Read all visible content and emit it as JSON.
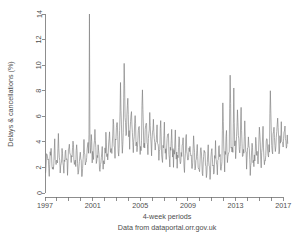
{
  "chart_data": {
    "type": "line",
    "title": "",
    "subtitle": "",
    "xlabel": "4-week periods",
    "ylabel": "Delays & cancellations (%)",
    "caption": "Data from dataportal.orr.gov.uk",
    "grid": false,
    "legend": "none",
    "line_color": "#7d7d7d",
    "axis_color": "#707070",
    "text_color": "#4d4d4d",
    "background": "#ffffff",
    "xlim": [
      1997.0,
      2017.4
    ],
    "ylim": [
      0,
      14
    ],
    "yticks": [
      0,
      2,
      4,
      6,
      8,
      10,
      12,
      14
    ],
    "ytick_labels": [
      "0",
      "2",
      "4",
      "6",
      "8",
      "10",
      "12",
      "14"
    ],
    "xticks": [
      1997,
      1998,
      1999,
      2000,
      2001,
      2002,
      2003,
      2004,
      2005,
      2006,
      2007,
      2008,
      2009,
      2010,
      2011,
      2012,
      2013,
      2014,
      2015,
      2016,
      2017
    ],
    "xtick_labels_shown": [
      "1997",
      "2001",
      "2005",
      "2009",
      "2013",
      "2017"
    ],
    "xtick_labels_at": [
      1997,
      2001,
      2005,
      2009,
      2013,
      2017
    ],
    "series": [
      {
        "name": "Delays & cancellations (%)",
        "x_start": 1997.05,
        "x_step": 0.0767,
        "values": [
          1.9,
          2.6,
          3.3,
          2.2,
          1.7,
          2.6,
          3.5,
          2.4,
          1.8,
          2.7,
          3.8,
          2.5,
          2.0,
          2.9,
          4.1,
          2.6,
          1.9,
          2.5,
          3.4,
          2.3,
          1.6,
          2.4,
          3.2,
          2.1,
          1.8,
          2.8,
          3.9,
          2.7,
          2.1,
          3.0,
          4.2,
          2.8,
          2.0,
          2.6,
          3.3,
          2.2,
          1.5,
          2.3,
          3.1,
          2.0,
          1.7,
          2.5,
          3.6,
          2.4,
          1.9,
          2.8,
          4.0,
          2.6,
          2.2,
          3.1,
          4.3,
          2.9,
          2.3,
          3.2,
          4.6,
          3.0,
          2.1,
          2.7,
          3.5,
          2.3,
          1.8,
          2.6,
          3.4,
          2.2,
          2.0,
          2.9,
          4.4,
          3.1,
          2.6,
          3.6,
          5.0,
          3.4,
          2.8,
          3.9,
          5.6,
          3.8,
          3.0,
          4.2,
          6.0,
          4.0,
          3.1,
          4.4,
          8.2,
          5.0,
          3.5,
          4.8,
          9.8,
          6.2,
          4.4,
          5.5,
          7.0,
          4.8,
          3.8,
          4.9,
          6.1,
          4.2,
          3.4,
          4.5,
          5.7,
          3.9,
          3.2,
          4.3,
          5.4,
          3.7,
          3.0,
          4.1,
          8.6,
          4.6,
          3.3,
          4.4,
          5.8,
          4.0,
          3.1,
          4.2,
          6.3,
          4.1,
          3.2,
          4.3,
          5.5,
          3.8,
          3.0,
          4.0,
          5.2,
          3.6,
          2.8,
          3.8,
          5.1,
          3.5,
          2.7,
          3.7,
          4.9,
          3.4,
          2.6,
          3.6,
          4.8,
          3.3,
          2.5,
          3.5,
          4.7,
          3.2,
          2.4,
          3.4,
          4.6,
          3.1,
          2.3,
          3.3,
          4.5,
          3.0,
          2.2,
          3.2,
          4.4,
          2.9,
          2.1,
          3.1,
          4.2,
          2.8,
          2.0,
          3.0,
          4.1,
          2.7,
          1.9,
          2.9,
          4.0,
          2.6,
          1.8,
          2.8,
          3.9,
          2.5,
          1.7,
          2.7,
          3.8,
          2.4,
          1.6,
          2.6,
          3.7,
          2.3,
          1.5,
          2.5,
          3.6,
          2.2,
          1.4,
          2.4,
          3.5,
          2.1,
          1.6,
          2.6,
          3.8,
          2.4,
          1.8,
          2.8,
          4.0,
          2.6,
          2.0,
          3.0,
          6.4,
          3.6,
          2.2,
          3.2,
          4.4,
          2.9,
          2.4,
          3.4,
          8.9,
          4.0,
          2.6,
          3.6,
          7.8,
          4.2,
          2.8,
          3.8,
          6.6,
          4.7,
          3.0,
          4.0,
          6.2,
          3.8,
          2.5,
          3.5,
          5.0,
          3.2,
          2.1,
          3.1,
          4.3,
          2.8,
          1.9,
          2.9,
          4.1,
          2.7,
          2.0,
          3.0,
          4.6,
          3.0,
          2.2,
          3.2,
          5.4,
          3.4,
          2.4,
          3.4,
          4.8,
          3.1,
          2.3,
          3.3,
          4.5,
          3.0,
          2.6,
          3.6,
          8.0,
          4.4,
          3.0,
          4.0,
          5.2,
          3.5,
          3.2,
          4.2,
          5.8,
          3.9,
          3.3,
          4.3,
          5.0,
          3.7,
          3.1,
          4.1,
          5.3,
          3.8,
          3.4,
          4.4,
          5.6,
          4.0,
          3.5,
          4.5,
          6.0,
          4.2,
          3.6,
          4.6,
          6.4,
          4.4,
          3.8,
          4.8,
          8.5,
          5.0,
          4.2,
          5.2,
          6.8,
          4.8,
          4.4,
          5.4,
          7.8,
          5.2,
          4.6,
          5.6,
          6.2,
          4.9,
          4.0,
          5.0,
          5.8,
          4.5,
          3.4,
          4.2,
          5.1,
          3.0
        ],
        "max_spike_value": 14.0,
        "max_spike_x": 2000.75
      }
    ]
  },
  "plot_geometry": {
    "left": 45,
    "right": 288,
    "top": 14,
    "bottom": 193
  }
}
